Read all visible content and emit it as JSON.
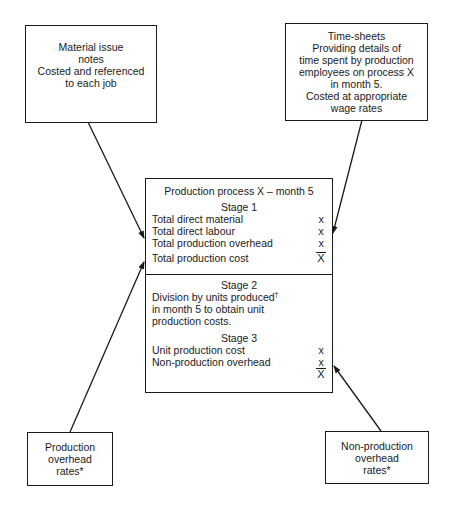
{
  "diagram": {
    "inputs": {
      "material": {
        "text": "Material issue\nnotes\nCosted and referenced\nto each job"
      },
      "timesheets": {
        "text": "Time-sheets\nProviding details of\ntime spent by production\nemployees on process X\nin month 5.\nCosted at appropriate\nwage rates"
      },
      "production_overhead": {
        "text": "Production\noverhead\nrates*"
      },
      "non_production_overhead": {
        "text": "Non-production\noverhead\nrates*"
      }
    },
    "process": {
      "title": "Production process X – month 5",
      "stage1": {
        "heading": "Stage 1",
        "rows": [
          {
            "label": "Total direct material",
            "value": "x"
          },
          {
            "label": "Total direct labour",
            "value": "x"
          },
          {
            "label": "Total production overhead",
            "value": "x"
          },
          {
            "label": "Total production cost",
            "value": "X"
          }
        ]
      },
      "stage2": {
        "heading": "Stage 2",
        "line1": "Division by units produced",
        "dagger": "†",
        "line2": "in month 5 to obtain unit",
        "line3": "production costs."
      },
      "stage3": {
        "heading": "Stage 3",
        "rows": [
          {
            "label": "Unit production cost",
            "value": "x"
          },
          {
            "label": "Non-production overhead",
            "value": "x"
          },
          {
            "label": "",
            "value": "X"
          }
        ]
      }
    },
    "arrows": [
      {
        "from": "material",
        "to": "process"
      },
      {
        "from": "timesheets",
        "to": "process"
      },
      {
        "from": "production_overhead",
        "to": "process"
      },
      {
        "from": "non_production_overhead",
        "to": "process"
      }
    ],
    "colors": {
      "line": "#1a1a1a",
      "background": "#ffffff"
    }
  }
}
